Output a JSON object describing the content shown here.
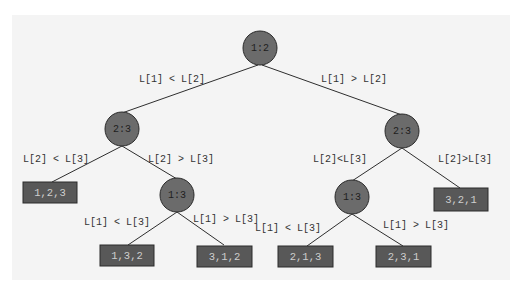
{
  "diagram": {
    "type": "decision-tree",
    "colors": {
      "background": "#ffffff",
      "panel": "#f4f4f4",
      "node_fill": "#6b6b6b",
      "leaf_fill": "#585858",
      "leaf_text": "#cfcfcf",
      "edge": "#2e2e2e"
    },
    "nodes": {
      "root": {
        "label": "1:2"
      },
      "left_23": {
        "label": "2:3"
      },
      "right_23": {
        "label": "2:3"
      },
      "left_13": {
        "label": "1:3"
      },
      "right_13": {
        "label": "1:3"
      }
    },
    "leaves": {
      "l123": {
        "label": "1,2,3"
      },
      "l132": {
        "label": "1,3,2"
      },
      "l312": {
        "label": "3,1,2"
      },
      "l213": {
        "label": "2,1,3"
      },
      "l231": {
        "label": "2,3,1"
      },
      "l321": {
        "label": "3,2,1"
      }
    },
    "edges": {
      "root_left": "L[1] < L[2]",
      "root_right": "L[1] > L[2]",
      "l23_left": "L[2] < L[3]",
      "l23_right": "L[2] > L[3]",
      "l13_left": "L[1] < L[3]",
      "l13_right": "L[1] > L[3]",
      "r23_left": "L[2]<L[3]",
      "r23_right": "L[2]>L[3]",
      "r13_left": "L[1] < L[3]",
      "r13_right": "L[1] > L[3]"
    }
  }
}
